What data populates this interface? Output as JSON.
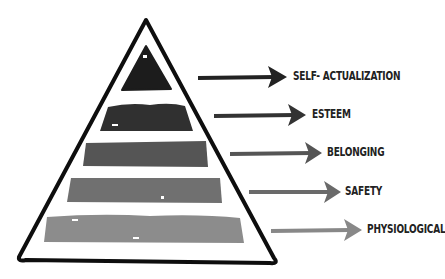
{
  "levels": [
    {
      "label": "SELF- ACTUALIZATION",
      "color": "#1c1c1c",
      "arrow_color": "#222222"
    },
    {
      "label": "ESTEEM",
      "color": "#303030",
      "arrow_color": "#333333"
    },
    {
      "label": "BELONGING",
      "color": "#555555",
      "arrow_color": "#555555"
    },
    {
      "label": "SAFETY",
      "color": "#707070",
      "arrow_color": "#6a6a6a"
    },
    {
      "label": "PHYSIOLOGICAL",
      "color": "#8c8c8c",
      "arrow_color": "#888888"
    }
  ],
  "colors": {
    "outline": "#0e0e0e",
    "background": "#ffffff",
    "label_text": "#222222"
  }
}
